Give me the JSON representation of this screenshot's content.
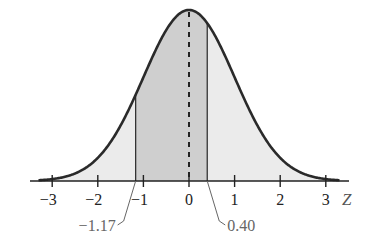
{
  "diagram": {
    "type": "standard-normal-distribution",
    "axis_label": "Z",
    "ticks": [
      "−3",
      "−2",
      "−1",
      "0",
      "1",
      "2",
      "3"
    ],
    "tick_values": [
      -3,
      -2,
      -1,
      0,
      1,
      2,
      3
    ],
    "shaded_region": {
      "from": -1.17,
      "to": 0.4
    },
    "markers": [
      {
        "value": -1.17,
        "label": "−1.17"
      },
      {
        "value": 0.4,
        "label": "0.40"
      }
    ],
    "mean_line": 0,
    "colors": {
      "curve": "#2a2a2a",
      "tail_fill": "#ebebeb",
      "center_fill": "#cfcfcf",
      "axis": "#222222",
      "callout_text": "#666666"
    }
  }
}
